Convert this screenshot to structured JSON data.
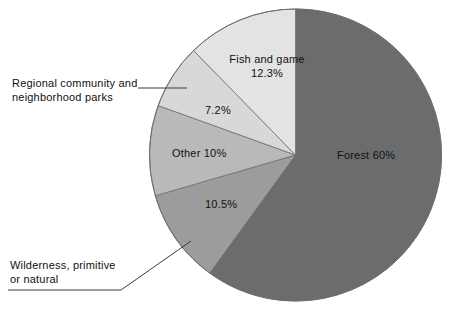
{
  "chart_data": {
    "type": "pie",
    "title": "",
    "subtitle": "",
    "xlabel": "",
    "ylabel": "",
    "legend_position": "none",
    "grid": false,
    "units": "percent",
    "start_angle_deg": 0,
    "direction": "clockwise-for-forest",
    "categories": [
      "Forest",
      "Wilderness, primitive or natural",
      "Other",
      "Regional community and neighborhood parks",
      "Fish and game"
    ],
    "values": [
      60,
      10.5,
      10,
      7.2,
      12.3
    ],
    "slices": [
      {
        "id": "forest",
        "name": "Forest",
        "value": 60,
        "value_text": "60%",
        "label_text": "Forest 60%",
        "label_placement": "inside",
        "color": "#6b6c6e",
        "start_deg": 0,
        "end_deg": 216
      },
      {
        "id": "wilderness",
        "name": "Wilderness, primitive or natural",
        "value": 10.5,
        "value_text": "10.5%",
        "label_text": "Wilderness, primitive or natural",
        "label_line1": "Wilderness, primitive",
        "label_line2": "or natural",
        "label_placement": "callout-left",
        "color": "#9c9c9c",
        "start_deg": 216,
        "end_deg": 253.8
      },
      {
        "id": "other",
        "name": "Other",
        "value": 10,
        "value_text": "10%",
        "label_text": "Other 10%",
        "label_placement": "inside",
        "color": "#b9b9b9",
        "start_deg": 253.8,
        "end_deg": 289.8
      },
      {
        "id": "regional",
        "name": "Regional community and neighborhood parks",
        "value": 7.2,
        "value_text": "7.2%",
        "label_text": "Regional community and neighborhood parks",
        "label_line1": "Regional community and",
        "label_line2": "neighborhood parks",
        "label_placement": "callout-left",
        "color": "#d8d8d8",
        "start_deg": 289.8,
        "end_deg": 315.7
      },
      {
        "id": "fish",
        "name": "Fish and game",
        "value": 12.3,
        "value_text": "12.3%",
        "label_line1": "Fish and game",
        "label_line2": "12.3%",
        "label_text": "Fish and game 12.3%",
        "label_placement": "inside",
        "color": "#e3e3e3",
        "start_deg": 315.7,
        "end_deg": 360
      }
    ],
    "total": 100,
    "colors": {
      "forest": "#6b6c6e",
      "wilderness": "#9c9c9c",
      "other": "#b9b9b9",
      "regional": "#d8d8d8",
      "fish": "#e3e3e3",
      "outline": "#6f6f6f",
      "leader_line": "#3a3a3a",
      "background": "#ffffff",
      "text": "#111111"
    }
  },
  "labels": {
    "forest": "Forest 60%",
    "fish_line1": "Fish and game",
    "fish_line2": "12.3%",
    "regional_pct": "7.2%",
    "other": "Other 10%",
    "wilderness_pct": "10.5%",
    "regional_line1": "Regional community and",
    "regional_line2": "neighborhood parks",
    "wilderness_line1": "Wilderness, primitive",
    "wilderness_line2": "or natural"
  }
}
